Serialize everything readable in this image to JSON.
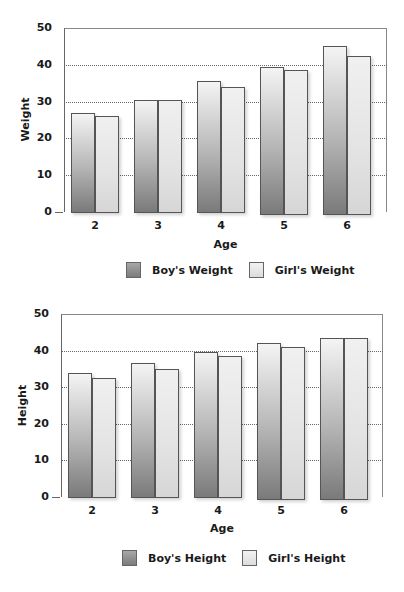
{
  "chart_data": [
    {
      "type": "bar",
      "title": "",
      "categories": [
        "2",
        "3",
        "4",
        "5",
        "6"
      ],
      "xlabel": "Age",
      "ylabel": "Weight",
      "ylim": [
        0,
        50
      ],
      "yticks": [
        "0",
        "10",
        "20",
        "30",
        "40",
        "50"
      ],
      "grid": true,
      "legend_position": "bottom",
      "series": [
        {
          "name": "Boy's Weight",
          "values": [
            27,
            30.5,
            35.5,
            39.5,
            45
          ]
        },
        {
          "name": "Girl's Weight",
          "values": [
            26,
            30.5,
            34,
            38.5,
            42.5
          ]
        }
      ]
    },
    {
      "type": "bar",
      "title": "",
      "categories": [
        "2",
        "3",
        "4",
        "5",
        "6"
      ],
      "xlabel": "Age",
      "ylabel": "Height",
      "ylim": [
        0,
        50
      ],
      "yticks": [
        "0",
        "10",
        "20",
        "30",
        "40",
        "50"
      ],
      "grid": true,
      "legend_position": "bottom",
      "series": [
        {
          "name": "Boy's Height",
          "values": [
            34,
            36.5,
            39.5,
            42,
            43.5
          ]
        },
        {
          "name": "Girl's Height",
          "values": [
            32.5,
            35,
            38.5,
            41,
            43.5
          ]
        }
      ]
    }
  ],
  "colors": {
    "boy": "#8a8a8a",
    "girl": "#e6e6e6",
    "gridline": "#666666"
  }
}
